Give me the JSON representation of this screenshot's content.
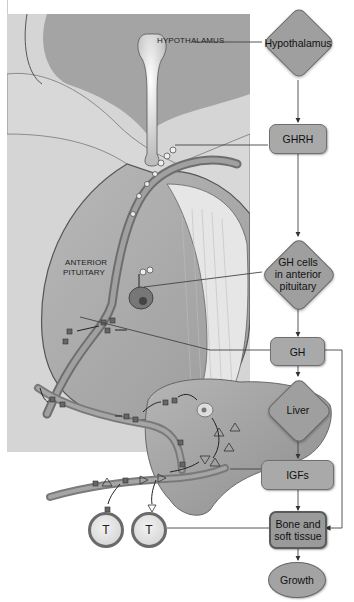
{
  "figure": {
    "caption_fragment": "...ating its growth...",
    "anatomy_labels": {
      "hypothalamus": "HYPOTHALAMUS",
      "anterior_pituitary_line1": "ANTERIOR",
      "anterior_pituitary_line2": "PITUITARY",
      "target_cell_1": "T",
      "target_cell_2": "T"
    }
  },
  "flowchart": {
    "nodes": [
      {
        "id": "hypothalamus",
        "shape": "diamond",
        "label": "Hypothalamus"
      },
      {
        "id": "ghrh",
        "shape": "rounded-box",
        "label": "GHRH"
      },
      {
        "id": "gh_cells",
        "shape": "diamond",
        "label_lines": [
          "GH cells",
          "in anterior",
          "pituitary"
        ]
      },
      {
        "id": "gh",
        "shape": "rounded-box",
        "label": "GH"
      },
      {
        "id": "liver",
        "shape": "diamond",
        "label": "Liver"
      },
      {
        "id": "igfs",
        "shape": "rounded-box",
        "label": "IGFs"
      },
      {
        "id": "bone_soft_tissue",
        "shape": "rounded-box",
        "label_lines": [
          "Bone and",
          "soft tissue"
        ]
      },
      {
        "id": "growth",
        "shape": "ellipse",
        "label": "Growth"
      }
    ],
    "edges": [
      [
        "hypothalamus",
        "ghrh"
      ],
      [
        "ghrh",
        "gh_cells"
      ],
      [
        "gh_cells",
        "gh"
      ],
      [
        "gh",
        "liver"
      ],
      [
        "liver",
        "igfs"
      ],
      [
        "igfs",
        "bone_soft_tissue"
      ],
      [
        "gh",
        "bone_soft_tissue"
      ],
      [
        "bone_soft_tissue",
        "growth"
      ]
    ]
  },
  "colors": {
    "node_fill": "#a9a9a9",
    "node_border": "#6f6f6f",
    "panel_bg": "#d5d5d5",
    "tissue": "#bdbdbd",
    "vessel": "#8a8a8a"
  }
}
